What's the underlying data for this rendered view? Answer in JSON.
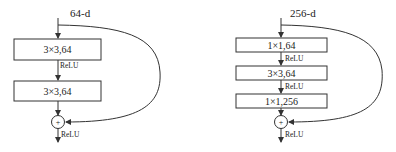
{
  "left_block": {
    "input_label": "64-d",
    "layers": [
      {
        "label": "3×3,64"
      },
      {
        "label": "3×3,64"
      }
    ],
    "activations": [
      "ReLU",
      "ReLU"
    ],
    "sum_symbol": "+"
  },
  "right_block": {
    "input_label": "256-d",
    "layers": [
      {
        "label": "1×1,64"
      },
      {
        "label": "3×3,64"
      },
      {
        "label": "1×1,256"
      }
    ],
    "activations": [
      "ReLU",
      "ReLU",
      "ReLU"
    ],
    "sum_symbol": "+"
  },
  "colors": {
    "stroke": "#333333",
    "text": "#222222",
    "background": "#ffffff"
  }
}
